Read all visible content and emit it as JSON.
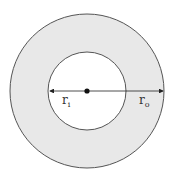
{
  "diagram": {
    "type": "annulus",
    "fill_color": "#e8e8e8",
    "stroke_color": "#555555",
    "inner_label": {
      "main": "r",
      "sub": "i"
    },
    "outer_label": {
      "main": "r",
      "sub": "o"
    }
  }
}
